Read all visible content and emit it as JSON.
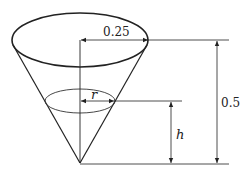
{
  "diagram": {
    "type": "cone-dimension-figure",
    "colors": {
      "stroke": "#222222",
      "background": "#ffffff"
    },
    "labels": {
      "top_radius": "0.25",
      "height": "0.5",
      "water_radius": "r",
      "water_height": "h"
    },
    "shapes": {
      "cone": {
        "apex": [
          80,
          163
        ],
        "top_ellipse": {
          "cx": 80,
          "cy": 40,
          "rx": 68,
          "ry": 27
        }
      },
      "water_surface": {
        "cx": 80,
        "cy": 101,
        "rx": 35,
        "ry": 12
      }
    }
  }
}
